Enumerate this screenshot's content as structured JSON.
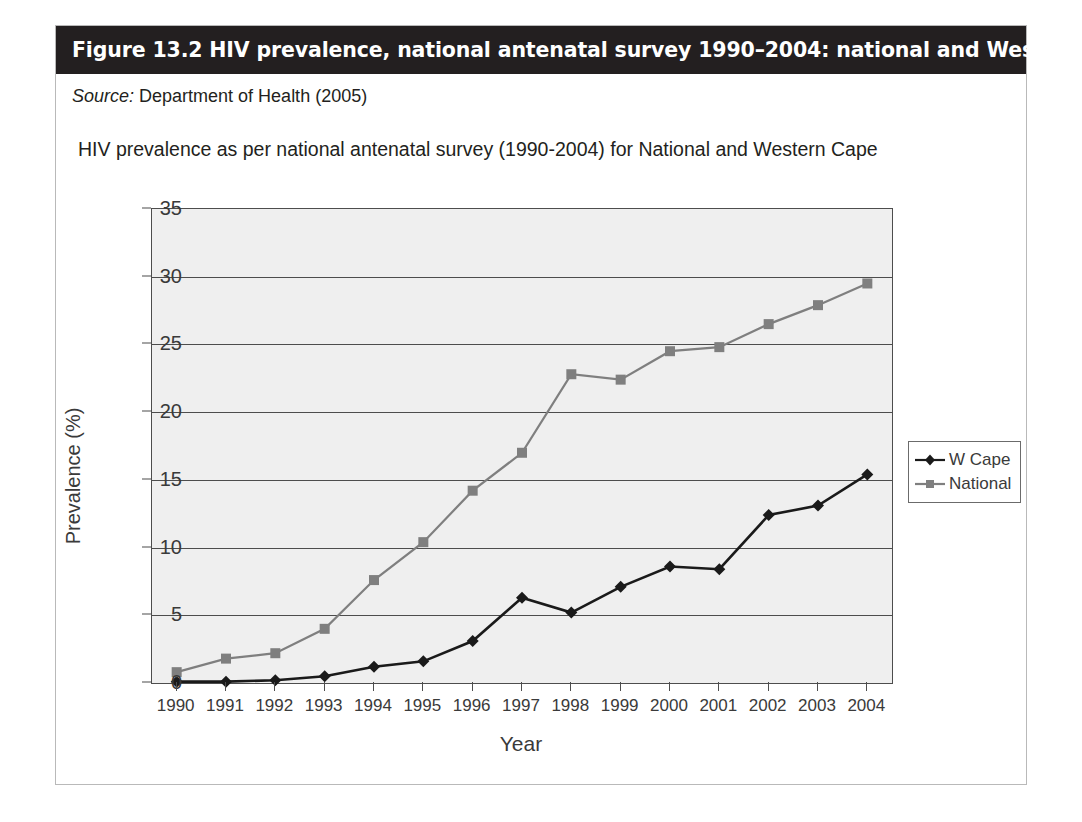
{
  "figure": {
    "caption": "Figure 13.2 HIV prevalence, national antenatal survey 1990–2004: national and Western Cape",
    "source_keyword": "Source:",
    "source_text": " Department of Health (2005)"
  },
  "colors": {
    "caption_bar": "#231f20",
    "plot_background": "#efefef",
    "axis": "#4d4d4d",
    "w_cape": "#1a1a1a",
    "national": "#7f7f7f",
    "frame_border": "#b9b9b9"
  },
  "chart_data": {
    "type": "line",
    "title": "HIV prevalence as per national antenatal survey (1990-2004) for National and Western Cape",
    "xlabel": "Year",
    "ylabel": "Prevalence (%)",
    "categories": [
      "1990",
      "1991",
      "1992",
      "1993",
      "1994",
      "1995",
      "1996",
      "1997",
      "1998",
      "1999",
      "2000",
      "2001",
      "2002",
      "2003",
      "2004"
    ],
    "ylim": [
      0,
      35
    ],
    "yticks": [
      0,
      5,
      10,
      15,
      20,
      25,
      30,
      35
    ],
    "grid": true,
    "legend_position": "right",
    "series": [
      {
        "name": "W Cape",
        "marker": "diamond",
        "color": "#1a1a1a",
        "values": [
          0.1,
          0.1,
          0.2,
          0.5,
          1.2,
          1.6,
          3.1,
          6.3,
          5.2,
          7.1,
          8.6,
          8.4,
          12.4,
          13.1,
          15.4
        ]
      },
      {
        "name": "National",
        "marker": "square",
        "color": "#7f7f7f",
        "values": [
          0.8,
          1.8,
          2.2,
          4.0,
          7.6,
          10.4,
          14.2,
          17.0,
          22.8,
          22.4,
          24.5,
          24.8,
          26.5,
          27.9,
          29.5
        ]
      }
    ]
  }
}
